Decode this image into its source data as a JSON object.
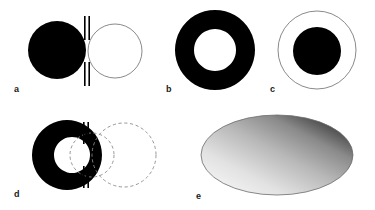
{
  "figure": {
    "title": "",
    "background_color": "#ffffff",
    "width": 375,
    "height": 210,
    "ink_color": "#000000",
    "outline_color": "#6b6b6b",
    "dashed_color": "#8a8a8a"
  },
  "panels": [
    {
      "id": "a",
      "label": "a",
      "description": "solid black disk adjacent to thin outlined circle separated by a vertical slit aperture",
      "elements": [
        {
          "name": "filled-disk",
          "type": "circle",
          "cx": 57,
          "cy": 50,
          "r": 29,
          "fill": "#000000"
        },
        {
          "name": "outlined-circle",
          "type": "circle",
          "cx": 115,
          "cy": 51,
          "r": 27,
          "fill": "none",
          "stroke": "#6b6b6b"
        },
        {
          "name": "slit-bar-upper",
          "type": "barpair",
          "x": 84,
          "y": 16,
          "w": 6,
          "h": 24
        },
        {
          "name": "slit-bar-lower",
          "type": "barpair",
          "x": 84,
          "y": 62,
          "w": 6,
          "h": 24
        }
      ]
    },
    {
      "id": "b",
      "label": "b",
      "description": "thick solid black annulus (ring)",
      "elements": [
        {
          "name": "annulus-outer",
          "type": "circle",
          "cx": 215,
          "cy": 50,
          "r": 40,
          "fill": "#000000"
        },
        {
          "name": "annulus-inner",
          "type": "circle",
          "cx": 215,
          "cy": 50,
          "r": 21,
          "fill": "#ffffff"
        }
      ]
    },
    {
      "id": "c",
      "label": "c",
      "description": "thin outlined circle containing a concentric solid black disk",
      "elements": [
        {
          "name": "outer-outline-circle",
          "type": "circle",
          "cx": 317,
          "cy": 50,
          "r": 39,
          "fill": "none",
          "stroke": "#6b6b6b"
        },
        {
          "name": "inner-filled-disk",
          "type": "circle",
          "cx": 317,
          "cy": 51,
          "r": 24,
          "fill": "#000000"
        }
      ]
    },
    {
      "id": "d",
      "label": "d",
      "description": "black annulus with open right side behind a slit aperture, with two overlapping dashed circles to the right",
      "elements": [
        {
          "name": "annulus-outer",
          "type": "circle",
          "cx": 67,
          "cy": 155,
          "r": 35,
          "fill": "#000000"
        },
        {
          "name": "annulus-inner",
          "type": "circle",
          "cx": 72,
          "cy": 155,
          "r": 18,
          "fill": "#ffffff"
        },
        {
          "name": "dashed-circle-small",
          "type": "circle",
          "cx": 92,
          "cy": 155,
          "r": 22,
          "fill": "none",
          "stroke": "#8a8a8a",
          "dashed": true
        },
        {
          "name": "dashed-circle-large",
          "type": "circle",
          "cx": 124,
          "cy": 155,
          "r": 32,
          "fill": "none",
          "stroke": "#8a8a8a",
          "dashed": true
        },
        {
          "name": "slit-bar-upper",
          "type": "barpair",
          "x": 83,
          "y": 122,
          "w": 6,
          "h": 22
        },
        {
          "name": "slit-bar-lower",
          "type": "barpair",
          "x": 83,
          "y": 166,
          "w": 6,
          "h": 22
        }
      ]
    },
    {
      "id": "e",
      "label": "e",
      "description": "ellipse shaded with a smooth gradient, light at the lower-left and dark at the upper-right",
      "elements": [
        {
          "name": "gradient-ellipse",
          "type": "ellipse",
          "cx": 277,
          "cy": 155,
          "rx": 76,
          "ry": 40,
          "stroke": "#6b6b6b",
          "gradient": {
            "type": "linear",
            "angle_description": "lower-left to upper-right",
            "stops": [
              {
                "offset": "0%",
                "color": "#fdfdfd"
              },
              {
                "offset": "28%",
                "color": "#e2e2e2"
              },
              {
                "offset": "52%",
                "color": "#b8b8b8"
              },
              {
                "offset": "72%",
                "color": "#8a8a8a"
              },
              {
                "offset": "88%",
                "color": "#454545"
              },
              {
                "offset": "100%",
                "color": "#060606"
              }
            ]
          }
        }
      ]
    }
  ],
  "labels": {
    "a": {
      "text": "a",
      "x": 14,
      "y": 85
    },
    "b": {
      "text": "b",
      "x": 166,
      "y": 85
    },
    "c": {
      "text": "c",
      "x": 270,
      "y": 85
    },
    "d": {
      "text": "d",
      "x": 14,
      "y": 190
    },
    "e": {
      "text": "e",
      "x": 196,
      "y": 192
    }
  }
}
